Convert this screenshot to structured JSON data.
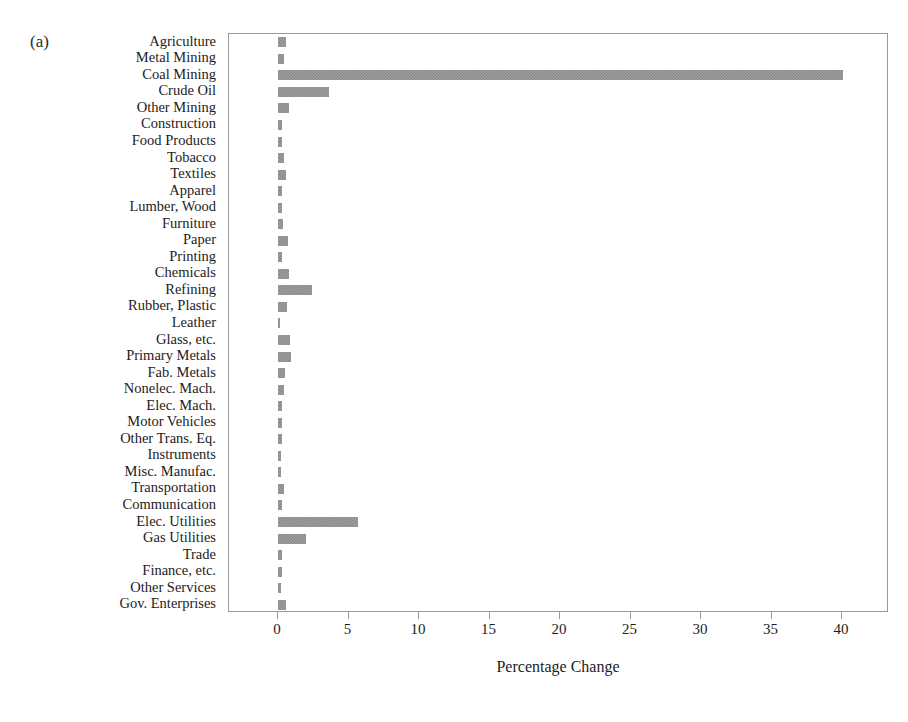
{
  "figure": {
    "panel_label": "(a)"
  },
  "chart_data": {
    "type": "bar",
    "orientation": "horizontal",
    "title": "",
    "subtitle": "",
    "xlabel": "Percentage Change",
    "ylabel": "",
    "xlim": [
      -1.5,
      43
    ],
    "xticks": [
      0,
      5,
      10,
      15,
      20,
      25,
      30,
      35,
      40
    ],
    "xticklabels": [
      "0",
      "5",
      "10",
      "15",
      "20",
      "25",
      "30",
      "35",
      "40"
    ],
    "grid": false,
    "legend": null,
    "bar_color": "#8d8d8d",
    "frame_color": "#9a9a9a",
    "categories": [
      "Agriculture",
      "Metal Mining",
      "Coal Mining",
      "Crude Oil",
      "Other Mining",
      "Construction",
      "Food Products",
      "Tobacco",
      "Textiles",
      "Apparel",
      "Lumber, Wood",
      "Furniture",
      "Paper",
      "Printing",
      "Chemicals",
      "Refining",
      "Rubber, Plastic",
      "Leather",
      "Glass, etc.",
      "Primary Metals",
      "Fab. Metals",
      "Nonelec. Mach.",
      "Elec. Mach.",
      "Motor Vehicles",
      "Other Trans. Eq.",
      "Instruments",
      "Misc. Manufac.",
      "Transportation",
      "Communication",
      "Elec. Utilities",
      "Gas Utilities",
      "Trade",
      "Finance, etc.",
      "Other Services",
      "Gov. Enterprises"
    ],
    "values": [
      0.6,
      0.45,
      40.1,
      3.6,
      0.75,
      0.3,
      0.3,
      0.45,
      0.6,
      0.25,
      0.3,
      0.35,
      0.7,
      0.3,
      0.75,
      2.4,
      0.65,
      0.1,
      0.85,
      0.9,
      0.5,
      0.45,
      0.3,
      0.3,
      0.3,
      0.2,
      0.2,
      0.4,
      0.25,
      5.7,
      2.0,
      0.25,
      0.25,
      0.2,
      0.55
    ]
  }
}
